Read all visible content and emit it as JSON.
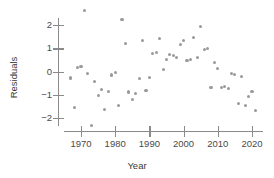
{
  "chart_data": {
    "type": "scatter",
    "title": "",
    "xlabel": "Year",
    "ylabel": "Residuals",
    "xlim": [
      1966,
      2022
    ],
    "ylim": [
      -2.5,
      2.8
    ],
    "xticks": [
      1970,
      1980,
      1990,
      2000,
      2010,
      2020
    ],
    "yticks": [
      2,
      1,
      0,
      -1,
      -2
    ],
    "ytick_labels": [
      "2",
      "1",
      "0",
      "−1",
      "−2"
    ],
    "xtick_labels": [
      "1970",
      "1980",
      "1990",
      "2000",
      "2010",
      "2020"
    ],
    "grid": false,
    "legend": null,
    "marker_color": "#9a9a9a",
    "axis_color": "#8a8a8a",
    "points": [
      {
        "x": 1967,
        "y": -0.28
      },
      {
        "x": 1968,
        "y": -1.55
      },
      {
        "x": 1969,
        "y": 0.17
      },
      {
        "x": 1970,
        "y": 0.22
      },
      {
        "x": 1971,
        "y": 2.62
      },
      {
        "x": 1972,
        "y": -0.08
      },
      {
        "x": 1973,
        "y": -2.32
      },
      {
        "x": 1974,
        "y": -0.43
      },
      {
        "x": 1975,
        "y": -1.05
      },
      {
        "x": 1976,
        "y": -0.78
      },
      {
        "x": 1977,
        "y": -1.62
      },
      {
        "x": 1978,
        "y": -0.85
      },
      {
        "x": 1979,
        "y": -0.15
      },
      {
        "x": 1980,
        "y": -0.05
      },
      {
        "x": 1981,
        "y": -1.48
      },
      {
        "x": 1982,
        "y": 2.22
      },
      {
        "x": 1983,
        "y": 1.2
      },
      {
        "x": 1984,
        "y": -0.88
      },
      {
        "x": 1985,
        "y": -1.22
      },
      {
        "x": 1986,
        "y": -0.95
      },
      {
        "x": 1987,
        "y": -0.32
      },
      {
        "x": 1988,
        "y": 1.32
      },
      {
        "x": 1989,
        "y": -0.82
      },
      {
        "x": 1990,
        "y": -0.25
      },
      {
        "x": 1991,
        "y": 0.78
      },
      {
        "x": 1992,
        "y": 0.8
      },
      {
        "x": 1993,
        "y": 1.42
      },
      {
        "x": 1994,
        "y": 0.08
      },
      {
        "x": 1995,
        "y": 0.52
      },
      {
        "x": 1996,
        "y": 0.72
      },
      {
        "x": 1997,
        "y": 0.7
      },
      {
        "x": 1998,
        "y": 0.62
      },
      {
        "x": 1999,
        "y": 1.18
      },
      {
        "x": 2000,
        "y": 1.32
      },
      {
        "x": 2001,
        "y": 0.48
      },
      {
        "x": 2002,
        "y": 0.5
      },
      {
        "x": 2003,
        "y": 1.45
      },
      {
        "x": 2004,
        "y": 0.62
      },
      {
        "x": 2005,
        "y": 1.95
      },
      {
        "x": 2006,
        "y": 0.95
      },
      {
        "x": 2007,
        "y": 0.98
      },
      {
        "x": 2008,
        "y": -0.7
      },
      {
        "x": 2009,
        "y": 0.38
      },
      {
        "x": 2010,
        "y": 0.12
      },
      {
        "x": 2011,
        "y": -0.68
      },
      {
        "x": 2012,
        "y": -0.65
      },
      {
        "x": 2013,
        "y": -0.72
      },
      {
        "x": 2014,
        "y": -0.08
      },
      {
        "x": 2015,
        "y": -0.12
      },
      {
        "x": 2016,
        "y": -1.38
      },
      {
        "x": 2017,
        "y": -0.2
      },
      {
        "x": 2018,
        "y": -1.48
      },
      {
        "x": 2019,
        "y": -1.08
      },
      {
        "x": 2020,
        "y": -0.85
      },
      {
        "x": 2021,
        "y": -1.68
      }
    ]
  }
}
